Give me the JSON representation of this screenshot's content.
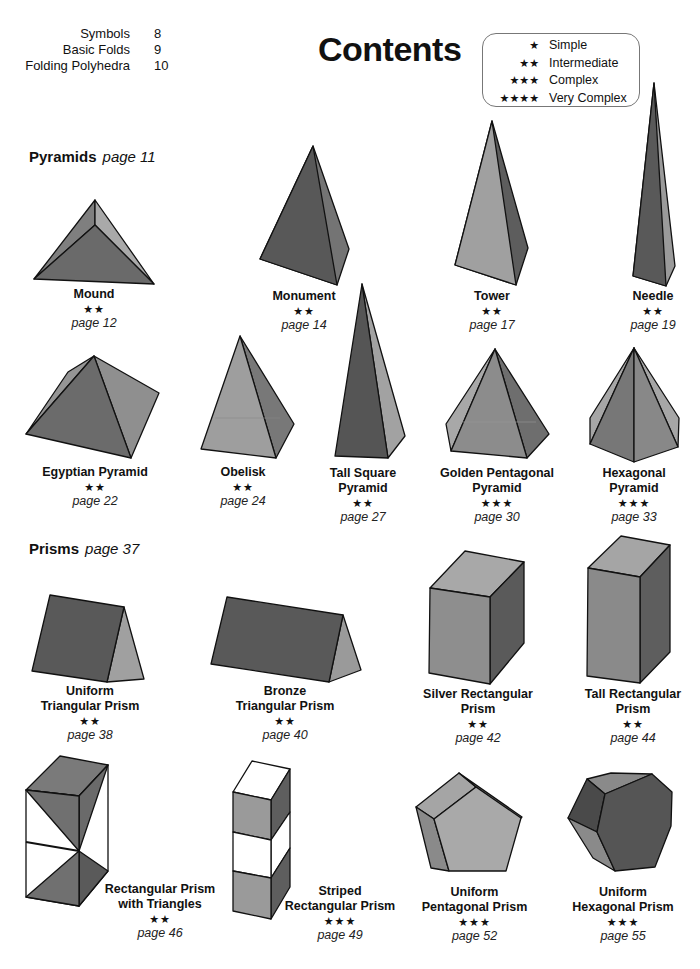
{
  "toc": [
    {
      "label": "Symbols",
      "page": "8"
    },
    {
      "label": "Basic Folds",
      "page": "9"
    },
    {
      "label": "Folding Polyhedra",
      "page": "10"
    }
  ],
  "title": "Contents",
  "legend": [
    {
      "stars": "★",
      "label": "Simple"
    },
    {
      "stars": "★★",
      "label": "Intermediate"
    },
    {
      "stars": "★★★",
      "label": "Complex"
    },
    {
      "stars": "★★★★",
      "label": "Very Complex"
    }
  ],
  "colors": {
    "dark": "#5a5a5a",
    "mid": "#7a7a7a",
    "light": "#a3a3a3",
    "white": "#ffffff",
    "edge": "#111111"
  },
  "sections": [
    {
      "name": "Pyramids",
      "page": "page 11"
    },
    {
      "name": "Prisms",
      "page": "page 37"
    }
  ],
  "models": [
    {
      "name": "Mound",
      "stars": "★★",
      "page": "page 12"
    },
    {
      "name": "Monument",
      "stars": "★★",
      "page": "page 14"
    },
    {
      "name": "Tower",
      "stars": "★★",
      "page": "page 17"
    },
    {
      "name": "Needle",
      "stars": "★★",
      "page": "page 19"
    },
    {
      "name": "Egyptian Pyramid",
      "stars": "★★",
      "page": "page 22"
    },
    {
      "name": "Obelisk",
      "stars": "★★",
      "page": "page 24"
    },
    {
      "name": "Tall Square Pyramid",
      "stars": "★★",
      "page": "page 27"
    },
    {
      "name": "Golden Pentagonal Pyramid",
      "stars": "★★★",
      "page": "page 30"
    },
    {
      "name": "Hexagonal Pyramid",
      "stars": "★★★",
      "page": "page 33"
    },
    {
      "name": "Uniform Triangular Prism",
      "stars": "★★",
      "page": "page 38"
    },
    {
      "name": "Bronze Triangular Prism",
      "stars": "★★",
      "page": "page 40"
    },
    {
      "name": "Silver Rectangular Prism",
      "stars": "★★",
      "page": "page 42"
    },
    {
      "name": "Tall Rectangular Prism",
      "stars": "★★",
      "page": "page 44"
    },
    {
      "name": "Rectangular Prism with Triangles",
      "stars": "★★",
      "page": "page 46"
    },
    {
      "name": "Striped Rectangular Prism",
      "stars": "★★★",
      "page": "page 49"
    },
    {
      "name": "Uniform Pentagonal Prism",
      "stars": "★★★",
      "page": "page 52"
    },
    {
      "name": "Uniform Hexagonal Prism",
      "stars": "★★★",
      "page": "page 55"
    }
  ],
  "caption_lines": {
    "tall_square_1": "Tall Square",
    "tall_square_2": "Pyramid",
    "golden_1": "Golden Pentagonal",
    "golden_2": "Pyramid",
    "hex_pyr_1": "Hexagonal",
    "hex_pyr_2": "Pyramid",
    "uni_tri_1": "Uniform",
    "uni_tri_2": "Triangular Prism",
    "bronze_1": "Bronze",
    "bronze_2": "Triangular Prism",
    "silver_1": "Silver Rectangular",
    "silver_2": "Prism",
    "tall_rect_1": "Tall Rectangular",
    "tall_rect_2": "Prism",
    "rect_tri_1": "Rectangular Prism",
    "rect_tri_2": "with Triangles",
    "striped_1": "Striped",
    "striped_2": "Rectangular Prism",
    "uni_pent_1": "Uniform",
    "uni_pent_2": "Pentagonal Prism",
    "uni_hex_1": "Uniform",
    "uni_hex_2": "Hexagonal Prism"
  }
}
